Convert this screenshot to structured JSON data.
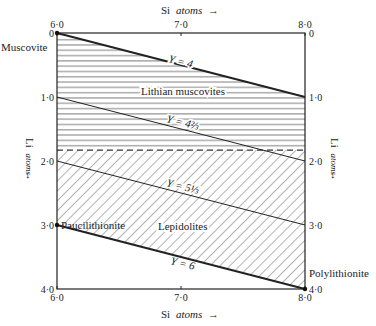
{
  "x_axis": {
    "label": "Si",
    "label_unit": "atoms",
    "arrow": "→",
    "ticks": [
      "6·0",
      "7·0",
      "8·0"
    ],
    "range": [
      6.0,
      8.0
    ]
  },
  "y_axis": {
    "label": "Li",
    "label_unit": "atoms",
    "arrow": "↓",
    "ticks_left": [
      "0",
      "1·0",
      "2·0",
      "3·0",
      "4·0"
    ],
    "ticks_right": [
      "0",
      "1·0",
      "2·0",
      "3·0",
      "4·0"
    ],
    "range": [
      0,
      4.0
    ]
  },
  "end_members": {
    "muscovite": "Muscovite",
    "paucilithionite": "Paucilithionite",
    "polylithionite": "Polylithionite"
  },
  "fields": {
    "lithian_muscovites": "Lithian muscovites",
    "lepidolites": "Lepidolites"
  },
  "y_lines": [
    {
      "label": "Y = 4",
      "si": [
        6.0,
        8.0
      ],
      "li": [
        0.0,
        1.0
      ],
      "weight": "bold"
    },
    {
      "label": "Y = 4⅔",
      "si": [
        6.0,
        8.0
      ],
      "li": [
        1.0,
        2.0
      ],
      "weight": "thin"
    },
    {
      "label": "Y = 5⅓",
      "si": [
        6.0,
        8.0
      ],
      "li": [
        2.0,
        3.0
      ],
      "weight": "thin"
    },
    {
      "label": "Y = 6",
      "si": [
        6.0,
        8.0
      ],
      "li": [
        3.0,
        4.0
      ],
      "weight": "bold"
    }
  ],
  "dashed_boundary_li": 1.83,
  "chart_data": {
    "type": "line",
    "title": "",
    "xlabel": "Si atoms",
    "ylabel": "Li atoms",
    "xlim": [
      6.0,
      8.0
    ],
    "ylim": [
      4.0,
      0
    ],
    "series": [
      {
        "name": "Y = 4",
        "x": [
          6.0,
          8.0
        ],
        "y": [
          0.0,
          1.0
        ]
      },
      {
        "name": "Y = 4⅔",
        "x": [
          6.0,
          8.0
        ],
        "y": [
          1.0,
          2.0
        ]
      },
      {
        "name": "Y = 5⅓",
        "x": [
          6.0,
          8.0
        ],
        "y": [
          2.0,
          3.0
        ]
      },
      {
        "name": "Y = 6",
        "x": [
          6.0,
          8.0
        ],
        "y": [
          3.0,
          4.0
        ]
      }
    ],
    "regions": [
      {
        "name": "Lithian muscovites",
        "li_range": [
          0,
          1.83
        ],
        "hatch": "horizontal"
      },
      {
        "name": "Lepidolites",
        "li_range": [
          1.83,
          "Y=6 line"
        ],
        "hatch": "diagonal"
      }
    ],
    "points": [
      {
        "name": "Muscovite",
        "x": 6.0,
        "y": 0.0
      },
      {
        "name": "Paucilithionite",
        "x": 6.0,
        "y": 3.0
      },
      {
        "name": "Polylithionite",
        "x": 8.0,
        "y": 4.0
      }
    ]
  }
}
